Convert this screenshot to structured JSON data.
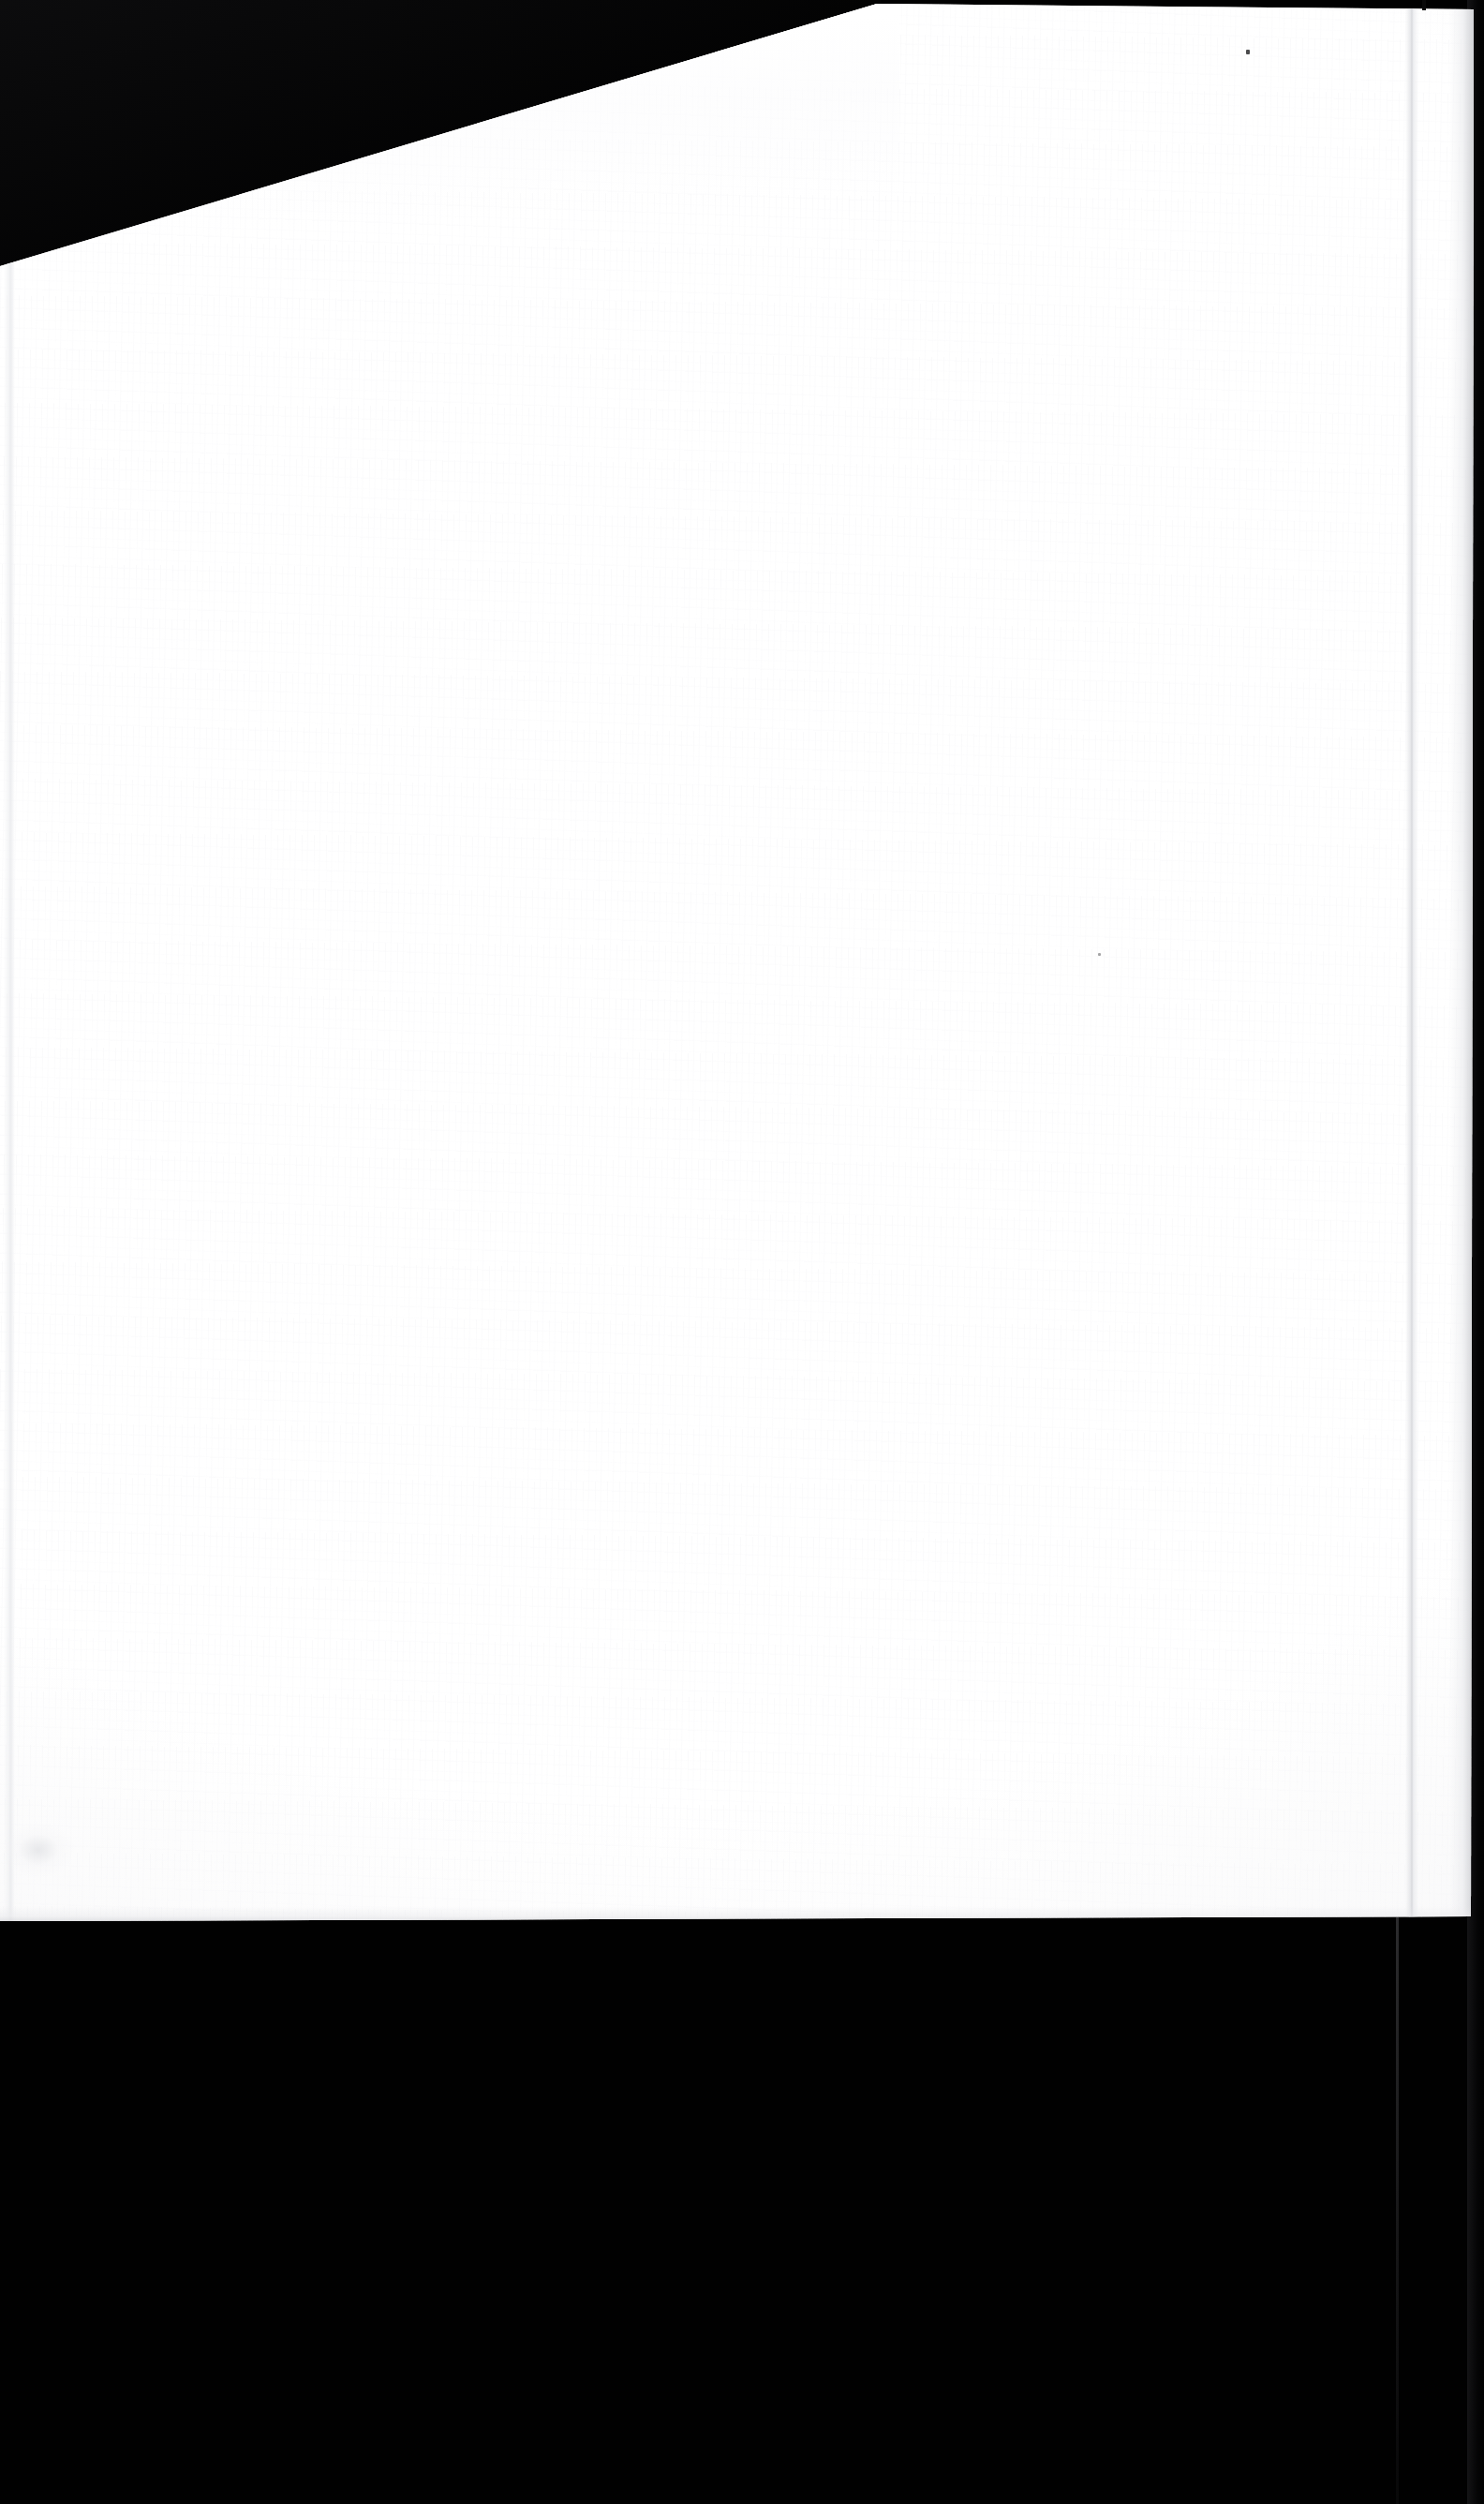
{
  "scan": {
    "canvas": {
      "width": 1584,
      "height": 2672,
      "background_color": "#000000"
    },
    "page": {
      "paper_color": "#FEFEFE",
      "content_text": "",
      "description": "Blank scanned page"
    }
  },
  "artifacts": {
    "speck_top_right_name": "dust speck",
    "speck_mid_name": "dust speck",
    "top_notch_name": "edge notch",
    "crease_right_name": "fold crease",
    "crease_left_name": "fold crease",
    "smudge_name": "paper smudge"
  }
}
